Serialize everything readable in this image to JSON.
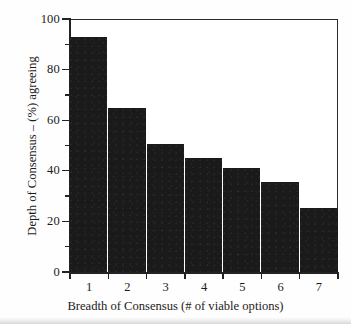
{
  "chart_data": {
    "type": "bar",
    "title": "",
    "subtitle": "",
    "categories": [
      "1",
      "2",
      "3",
      "4",
      "5",
      "6",
      "7"
    ],
    "values": [
      93,
      65,
      50.5,
      45,
      41,
      35.5,
      25.5
    ],
    "xlabel": "Breadth of Consensus (# of viable options)",
    "ylabel": "Depth of Consensus – (%) agreeing",
    "ylim": [
      0,
      100
    ],
    "y_major_ticks": [
      "0",
      "20",
      "40",
      "60",
      "80",
      "100"
    ],
    "y_minor_tick_values": [
      10,
      30,
      50,
      70,
      90
    ],
    "grid": false,
    "legend": false,
    "legend_position": "none",
    "bar_color": "#1a1a1a",
    "axis_color": "#232323",
    "background_color": "#ffffff"
  }
}
